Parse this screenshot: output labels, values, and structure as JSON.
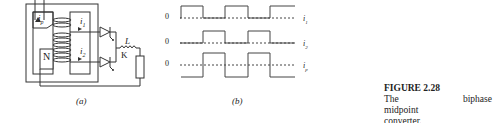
{
  "figure": {
    "number_label": "FIGURE 2.28",
    "caption_line1": "The biphase midpoint",
    "caption_line2": "converter."
  },
  "panel_a": {
    "label": "(a)",
    "labels": {
      "ip": "i",
      "ip_sub": "p",
      "i1": "i",
      "i1_sub": "1",
      "i2": "i",
      "i2_sub": "2",
      "neutral": "N",
      "inductor": "L",
      "cathode": "K"
    }
  },
  "panel_b": {
    "label": "(b)",
    "traces": [
      {
        "zero_label": "0",
        "name": "i",
        "sub": "1"
      },
      {
        "zero_label": "0",
        "name": "i",
        "sub": "2"
      },
      {
        "zero_label": "0",
        "name": "i",
        "sub": "p"
      }
    ]
  }
}
